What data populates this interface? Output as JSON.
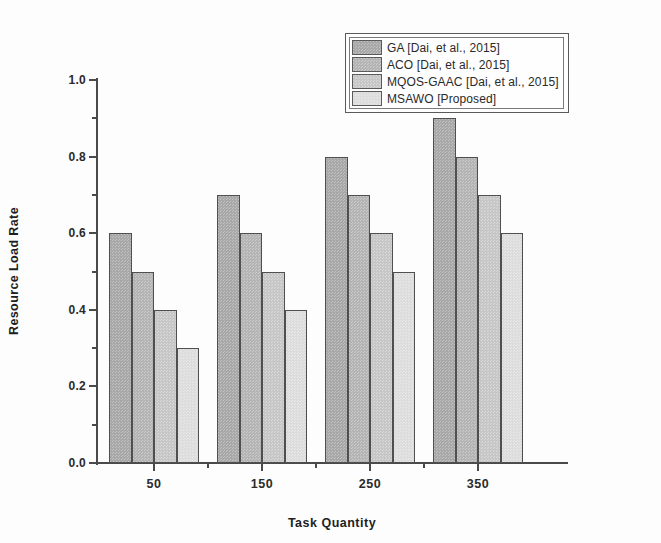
{
  "chart_data": {
    "type": "bar",
    "title": "",
    "subtitle": "",
    "xlabel": "Task Quantity",
    "ylabel": "Resource Load Rate",
    "categories": [
      "50",
      "150",
      "250",
      "350"
    ],
    "series": [
      {
        "name": "GA [Dai, et al., 2015]",
        "values": [
          0.6,
          0.7,
          0.8,
          0.9
        ],
        "color": "#a8a8a8"
      },
      {
        "name": "ACO  [Dai, et al., 2015]",
        "values": [
          0.5,
          0.6,
          0.7,
          0.8
        ],
        "color": "#b4b4b4"
      },
      {
        "name": "MQOS-GAAC [Dai, et al., 2015]",
        "values": [
          0.4,
          0.5,
          0.6,
          0.7
        ],
        "color": "#c6c6c6"
      },
      {
        "name": "MSAWO [Proposed]",
        "values": [
          0.3,
          0.4,
          0.5,
          0.6
        ],
        "color": "#dcdcdc"
      }
    ],
    "ylim": [
      0.0,
      1.0
    ],
    "y_ticks": [
      "0.0",
      "0.2",
      "0.4",
      "0.6",
      "0.8",
      "1.0"
    ],
    "y_tick_values": [
      0.0,
      0.2,
      0.4,
      0.6,
      0.8,
      1.0
    ],
    "y_minor_tick_values": [
      0.1,
      0.3,
      0.5,
      0.7,
      0.9
    ],
    "x_ticks": [
      "50",
      "150",
      "250",
      "350"
    ],
    "grid": false,
    "legend_position": "top-right",
    "legend_entries": [
      "GA [Dai, et al., 2015]",
      "ACO  [Dai, et al., 2015]",
      "MQOS-GAAC [Dai, et al., 2015]",
      "MSAWO [Proposed]"
    ],
    "axis_color": "#4a4a4a",
    "bar_edge_color": "#4f4f4f",
    "background_color": "#ffffff"
  }
}
